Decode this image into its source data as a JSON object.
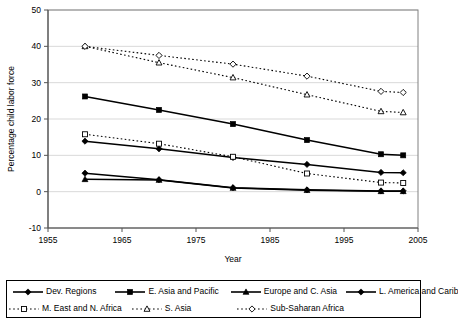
{
  "chart_data": {
    "type": "line",
    "title": "",
    "xlabel": "Year",
    "ylabel": "Percentage child labor force",
    "xlim": [
      1955,
      2005
    ],
    "ylim": [
      -10,
      50
    ],
    "xticks": [
      1955,
      1965,
      1975,
      1985,
      1995,
      2005
    ],
    "yticks": [
      -10,
      0,
      10,
      20,
      30,
      40,
      50
    ],
    "grid": "horizontal",
    "legend_position": "bottom",
    "x": [
      1960,
      1970,
      1980,
      1990,
      2000,
      2003
    ],
    "series": [
      {
        "name": "Dev. Regions",
        "marker": "filled-diamond",
        "line": "solid",
        "values": [
          13.9,
          11.8,
          9.4,
          7.5,
          5.3,
          5.2
        ]
      },
      {
        "name": "E. Asia and Pacific",
        "marker": "filled-square",
        "line": "solid",
        "values": [
          26.2,
          22.5,
          18.6,
          14.2,
          10.3,
          10.0
        ]
      },
      {
        "name": "Europe and C. Asia",
        "marker": "filled-triangle",
        "line": "solid",
        "values": [
          3.4,
          3.2,
          1.0,
          0.4,
          0.1,
          0.1
        ]
      },
      {
        "name": "L. America and Carib",
        "marker": "filled-diamond",
        "line": "solid",
        "values": [
          5.1,
          3.3,
          1.1,
          0.5,
          0.2,
          0.2
        ]
      },
      {
        "name": "M. East and N. Africa",
        "marker": "open-square",
        "line": "dotted",
        "values": [
          15.8,
          13.2,
          9.6,
          5.0,
          2.5,
          2.4
        ]
      },
      {
        "name": "S. Asia",
        "marker": "open-triangle",
        "line": "dotted",
        "values": [
          40.0,
          35.5,
          31.4,
          26.7,
          22.1,
          21.8
        ]
      },
      {
        "name": "Sub-Saharan Africa",
        "marker": "open-diamond",
        "line": "dotted",
        "values": [
          40.0,
          37.5,
          35.1,
          31.8,
          27.6,
          27.3
        ]
      }
    ]
  },
  "axes": {
    "y_title": "Percentage child labor force",
    "x_title": "Year",
    "y_tick_labels": [
      "50",
      "40",
      "30",
      "20",
      "10",
      "0",
      "-10"
    ],
    "x_tick_labels": [
      "1955",
      "1965",
      "1975",
      "1985",
      "1995",
      "2005"
    ]
  },
  "legend": {
    "row0": [
      {
        "label": "Dev. Regions",
        "marker": "filled-diamond",
        "line": "solid"
      },
      {
        "label": "E. Asia and Pacific",
        "marker": "filled-square",
        "line": "solid"
      },
      {
        "label": "Europe and C. Asia",
        "marker": "filled-triangle",
        "line": "solid"
      },
      {
        "label": "L. America and Carib",
        "marker": "filled-diamond",
        "line": "solid"
      }
    ],
    "row1": [
      {
        "label": "M. East and N. Africa",
        "marker": "open-square",
        "line": "dotted"
      },
      {
        "label": "S. Asia",
        "marker": "open-triangle",
        "line": "dotted"
      },
      {
        "label": "Sub-Saharan Africa",
        "marker": "open-diamond",
        "line": "dotted"
      }
    ]
  },
  "colors": {
    "line": "#000000",
    "grid": "#d9d9d9",
    "frame": "#808080",
    "background": "#ffffff",
    "marker_fill": "#000000",
    "marker_open_fill": "#ffffff"
  }
}
